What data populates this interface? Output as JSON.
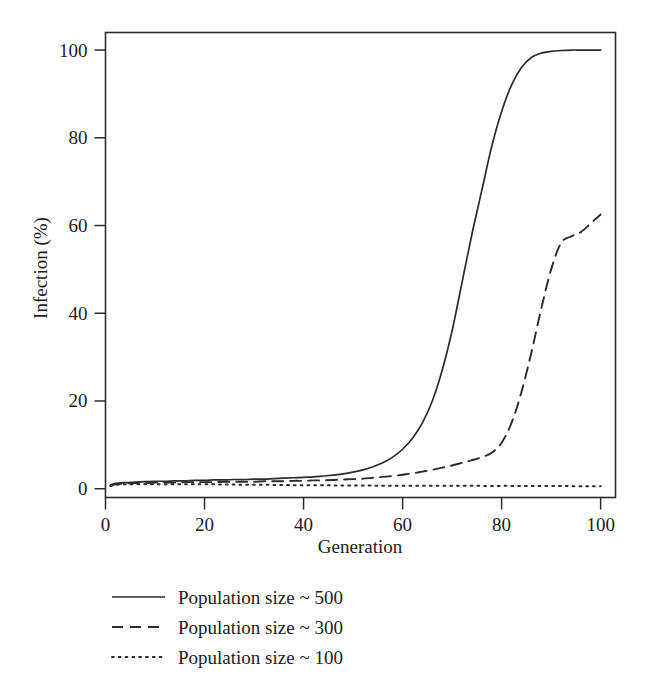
{
  "chart_data": {
    "type": "line",
    "title": "",
    "xlabel": "Generation",
    "ylabel": "Infection (%)",
    "xlim": [
      0,
      103
    ],
    "ylim": [
      -2,
      104
    ],
    "xticks": [
      0,
      20,
      40,
      60,
      80,
      100
    ],
    "xtick_labels": [
      "0",
      "20",
      "40",
      "60",
      "80",
      "100"
    ],
    "yticks": [
      0,
      20,
      40,
      60,
      80,
      100
    ],
    "ytick_labels": [
      "0",
      "20",
      "40",
      "60",
      "80",
      "100"
    ],
    "grid": false,
    "legend_position": "below-axes-left",
    "frame": "box",
    "line_color": "#2b2b2b",
    "background": "#ffffff",
    "x": [
      1,
      2,
      4,
      6,
      8,
      10,
      12,
      14,
      16,
      18,
      20,
      22,
      24,
      26,
      28,
      30,
      32,
      34,
      36,
      38,
      40,
      42,
      44,
      46,
      48,
      50,
      52,
      54,
      56,
      58,
      60,
      62,
      64,
      66,
      68,
      70,
      72,
      74,
      76,
      78,
      80,
      82,
      84,
      86,
      88,
      90,
      92,
      94,
      96,
      98,
      100
    ],
    "series": [
      {
        "name": "Population size ~ 500",
        "dash": "solid",
        "values": [
          0.8,
          1.2,
          1.4,
          1.5,
          1.6,
          1.7,
          1.7,
          1.8,
          1.8,
          1.9,
          1.9,
          2.0,
          2.0,
          2.1,
          2.1,
          2.2,
          2.2,
          2.3,
          2.4,
          2.5,
          2.6,
          2.7,
          2.9,
          3.1,
          3.4,
          3.8,
          4.3,
          5.0,
          5.9,
          7.2,
          9.0,
          11.5,
          15.0,
          20.0,
          27.0,
          36.0,
          47.0,
          58.0,
          68.0,
          78.0,
          86.0,
          92.0,
          96.0,
          98.3,
          99.3,
          99.7,
          99.9,
          100.0,
          100.0,
          100.0,
          100.0
        ]
      },
      {
        "name": "Population size ~ 300",
        "dash": "dashed",
        "values": [
          0.7,
          1.0,
          1.2,
          1.3,
          1.3,
          1.4,
          1.4,
          1.4,
          1.5,
          1.5,
          1.5,
          1.5,
          1.6,
          1.6,
          1.6,
          1.6,
          1.7,
          1.7,
          1.7,
          1.8,
          1.8,
          1.9,
          1.9,
          2.0,
          2.1,
          2.2,
          2.3,
          2.5,
          2.7,
          2.9,
          3.2,
          3.5,
          3.9,
          4.3,
          4.8,
          5.3,
          5.9,
          6.5,
          7.2,
          8.2,
          10.5,
          15.0,
          22.0,
          31.0,
          41.0,
          50.0,
          56.0,
          57.5,
          58.5,
          60.5,
          62.5
        ]
      },
      {
        "name": "Population size ~ 100",
        "dash": "dotted",
        "values": [
          0.6,
          0.9,
          1.0,
          1.0,
          1.0,
          1.0,
          1.0,
          1.0,
          1.0,
          1.0,
          1.0,
          1.0,
          0.95,
          0.95,
          0.9,
          0.9,
          0.9,
          0.85,
          0.85,
          0.8,
          0.8,
          0.8,
          0.8,
          0.75,
          0.75,
          0.75,
          0.75,
          0.7,
          0.7,
          0.7,
          0.7,
          0.7,
          0.7,
          0.7,
          0.7,
          0.7,
          0.7,
          0.7,
          0.65,
          0.65,
          0.65,
          0.65,
          0.6,
          0.6,
          0.6,
          0.6,
          0.6,
          0.6,
          0.55,
          0.55,
          0.55
        ]
      }
    ]
  },
  "legend": {
    "items": [
      {
        "label": "Population size ~ 500",
        "dash": "solid"
      },
      {
        "label": "Population size ~ 300",
        "dash": "dashed"
      },
      {
        "label": "Population size ~ 100",
        "dash": "dotted"
      }
    ]
  }
}
